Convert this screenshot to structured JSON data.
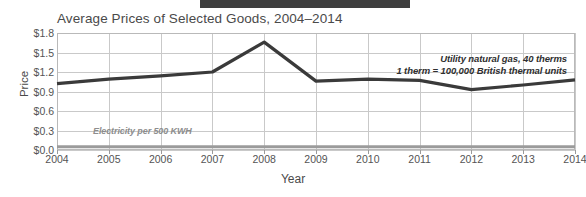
{
  "top_bar": {
    "color": "#3f3f3f"
  },
  "chart_data": {
    "type": "line",
    "title": "Average Prices of Selected Goods, 2004–2014",
    "xlabel": "Year",
    "ylabel": "Price",
    "grid": true,
    "legend_position": "inline-annotations",
    "x": [
      2004,
      2005,
      2006,
      2007,
      2008,
      2009,
      2010,
      2011,
      2012,
      2013,
      2014
    ],
    "xtick_labels": [
      "2004",
      "2005",
      "2006",
      "2007",
      "2008",
      "2009",
      "2010",
      "2011",
      "2012",
      "2013",
      "2014"
    ],
    "xlim": [
      2004,
      2014
    ],
    "ylim": [
      0.0,
      1.8
    ],
    "ytick_labels": [
      "$0.0",
      "$0.3",
      "$0.6",
      "$0.9",
      "$1.2",
      "$1.5",
      "$1.8"
    ],
    "ytick_values": [
      0.0,
      0.3,
      0.6,
      0.9,
      1.2,
      1.5,
      1.8
    ],
    "series": [
      {
        "name": "Utility natural gas, 40 therms",
        "color": "#3a3a3a",
        "values": [
          1.02,
          1.09,
          1.14,
          1.2,
          1.66,
          1.06,
          1.09,
          1.07,
          0.93,
          1.0,
          1.08
        ]
      },
      {
        "name": "Electricity per 500 KWH",
        "color": "#9b9b9b",
        "values": [
          0.05,
          0.05,
          0.05,
          0.05,
          0.05,
          0.05,
          0.05,
          0.05,
          0.05,
          0.05,
          0.05
        ]
      }
    ],
    "annotations": [
      {
        "id": "gas-line-1",
        "text": "Utility natural gas,  40 therms"
      },
      {
        "id": "gas-line-2",
        "text": "1 therm = 100,000 British thermal units"
      },
      {
        "id": "electricity",
        "text": "Electricity per 500 KWH"
      }
    ]
  }
}
